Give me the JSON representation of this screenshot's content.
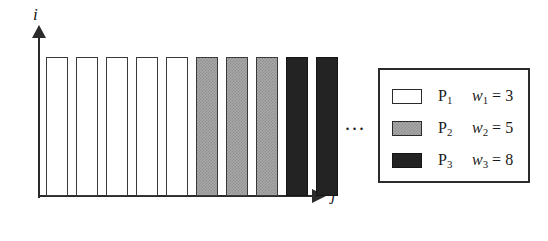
{
  "axes": {
    "vertical_label": "i",
    "horizontal_label": "j"
  },
  "ellipsis": "...",
  "legend": {
    "rows": [
      {
        "swatch": "white-rect-swatch",
        "process": "P",
        "process_index": "1",
        "weight_symbol": "w",
        "weight_index": "1",
        "equals": "=",
        "weight_value": "3"
      },
      {
        "swatch": "gray-rect-swatch",
        "process": "P",
        "process_index": "2",
        "weight_symbol": "w",
        "weight_index": "2",
        "equals": "=",
        "weight_value": "5"
      },
      {
        "swatch": "black-rect-swatch",
        "process": "P",
        "process_index": "3",
        "weight_symbol": "w",
        "weight_index": "3",
        "equals": "=",
        "weight_value": "8"
      }
    ]
  },
  "chart_data": {
    "type": "bar",
    "title": "",
    "xlabel": "j",
    "ylabel": "i",
    "grid": false,
    "legend_position": "right",
    "categories": [
      "1",
      "2",
      "3",
      "4",
      "5",
      "6",
      "7",
      "8",
      "9",
      "10"
    ],
    "values": [
      1,
      1,
      1,
      1,
      1,
      1,
      1,
      1,
      1,
      1
    ],
    "bar_classes": [
      "p1",
      "p1",
      "p1",
      "p1",
      "p1",
      "p2",
      "p2",
      "p2",
      "p3",
      "p3"
    ],
    "series": [
      {
        "name": "P1",
        "weight": 3,
        "fill": "white",
        "count": 5
      },
      {
        "name": "P2",
        "weight": 5,
        "fill": "gray",
        "count": 3
      },
      {
        "name": "P3",
        "weight": 8,
        "fill": "black",
        "count": 2
      }
    ],
    "annotations": [
      "..."
    ]
  },
  "colors": {
    "white_fill": "#ffffff",
    "gray_fill": "#a8a8a8",
    "black_fill": "#232323",
    "stroke": "#2b2b2b"
  }
}
